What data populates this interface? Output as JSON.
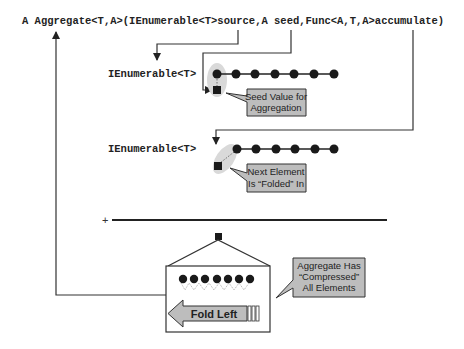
{
  "signature": {
    "text": "A Aggregate<T,A>(IEnumerable<T>source,A seed,Func<A,T,A>accumulate)"
  },
  "sequences": [
    {
      "label": "IEnumerable<T>",
      "element_count": 7
    },
    {
      "label": "IEnumerable<T>",
      "element_count": 6
    }
  ],
  "callouts": {
    "seed": [
      "Seed Value for",
      "Aggregation"
    ],
    "fold": [
      "Next Element",
      "Is “Folded” In"
    ],
    "result": [
      "Aggregate Has",
      "“Compressed”",
      "All Elements"
    ]
  },
  "plus_sign": "+",
  "fold_arrow": {
    "label": "Fold Left"
  },
  "compressed_elements": 7,
  "colors": {
    "line": "#333333",
    "node": "#1a1a1a",
    "callout_fill": "#bdbdbd",
    "highlight": "#d9d9d9"
  }
}
